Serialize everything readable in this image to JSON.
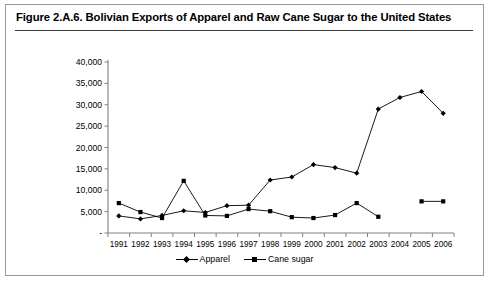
{
  "figure": {
    "title": "Figure 2.A.6. Bolivian Exports of Apparel and Raw Cane Sugar to the United States"
  },
  "chart_data": {
    "type": "line",
    "title": "Figure 2.A.6. Bolivian Exports of Apparel and Raw Cane Sugar to the United States",
    "xlabel": "",
    "ylabel": "",
    "categories": [
      "1991",
      "1992",
      "1993",
      "1994",
      "1995",
      "1996",
      "1997",
      "1998",
      "1999",
      "2000",
      "2001",
      "2002",
      "2003",
      "2004",
      "2005",
      "2006"
    ],
    "ylim": [
      0,
      40000
    ],
    "ytick_labels": [
      "-",
      "5,000",
      "10,000",
      "15,000",
      "20,000",
      "25,000",
      "30,000",
      "35,000",
      "40,000"
    ],
    "ytick_values": [
      0,
      5000,
      10000,
      15000,
      20000,
      25000,
      30000,
      35000,
      40000
    ],
    "grid": false,
    "legend_position": "bottom",
    "series": [
      {
        "name": "Apparel",
        "marker": "diamond",
        "color": "#000000",
        "values": [
          4000,
          3300,
          4100,
          5200,
          4800,
          6400,
          6500,
          12400,
          13100,
          16000,
          15300,
          14000,
          29000,
          31700,
          33100,
          28000
        ]
      },
      {
        "name": "Cane sugar",
        "marker": "square",
        "color": "#000000",
        "values": [
          7000,
          4900,
          3500,
          12200,
          4100,
          4000,
          5600,
          5100,
          3700,
          3500,
          4200,
          7000,
          3800,
          null,
          7400,
          7400
        ]
      }
    ]
  },
  "legend": {
    "items": [
      {
        "label": "Apparel"
      },
      {
        "label": "Cane sugar"
      }
    ]
  }
}
